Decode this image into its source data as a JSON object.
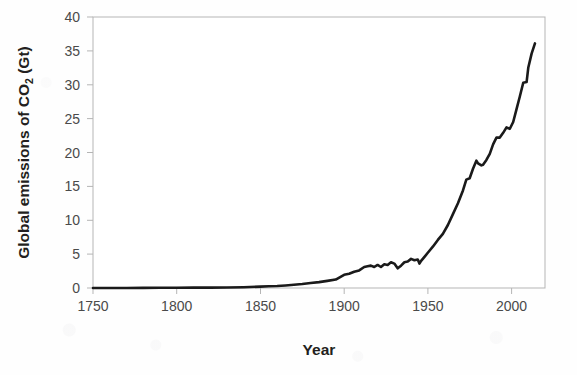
{
  "chart_data": {
    "type": "line",
    "title": "",
    "xlabel": "Year",
    "ylabel": "Global emissions of CO2 (Gt)",
    "ylabel_parts": {
      "pre": "Global emissions of CO",
      "sub": "2",
      "post": " (Gt)"
    },
    "xlim": [
      1750,
      2020
    ],
    "ylim": [
      0,
      40
    ],
    "xticks": [
      1750,
      1800,
      1850,
      1900,
      1950,
      2000
    ],
    "yticks": [
      0,
      5,
      10,
      15,
      20,
      25,
      30,
      35,
      40
    ],
    "xtick_labels": [
      "1750",
      "1800",
      "1850",
      "1900",
      "1950",
      "2000"
    ],
    "ytick_labels": [
      "0",
      "5",
      "10",
      "15",
      "20",
      "25",
      "30",
      "35",
      "40"
    ],
    "grid": false,
    "legend": null,
    "series": [
      {
        "name": "Global CO2 emissions",
        "color": "#1a1a1a",
        "line_width": 2.6,
        "x": [
          1750,
          1760,
          1770,
          1780,
          1790,
          1800,
          1810,
          1820,
          1830,
          1840,
          1850,
          1855,
          1860,
          1865,
          1870,
          1875,
          1880,
          1885,
          1890,
          1895,
          1900,
          1903,
          1906,
          1909,
          1912,
          1914,
          1916,
          1918,
          1920,
          1922,
          1924,
          1926,
          1928,
          1930,
          1932,
          1934,
          1936,
          1938,
          1940,
          1942,
          1944,
          1945,
          1946,
          1948,
          1950,
          1953,
          1956,
          1959,
          1962,
          1965,
          1968,
          1971,
          1973,
          1975,
          1977,
          1979,
          1980,
          1982,
          1983,
          1985,
          1987,
          1989,
          1991,
          1993,
          1995,
          1997,
          1999,
          2001,
          2003,
          2005,
          2007,
          2009,
          2010,
          2012,
          2014
        ],
        "y": [
          0.01,
          0.01,
          0.01,
          0.02,
          0.03,
          0.03,
          0.05,
          0.06,
          0.08,
          0.12,
          0.2,
          0.25,
          0.3,
          0.38,
          0.47,
          0.58,
          0.75,
          0.87,
          1.05,
          1.25,
          1.95,
          2.1,
          2.4,
          2.6,
          3.1,
          3.2,
          3.3,
          3.1,
          3.4,
          3.1,
          3.5,
          3.4,
          3.8,
          3.6,
          2.9,
          3.3,
          3.8,
          3.9,
          4.3,
          4.1,
          4.2,
          3.6,
          4.0,
          4.6,
          5.2,
          6.1,
          7.1,
          8.0,
          9.3,
          10.9,
          12.5,
          14.4,
          16.0,
          16.2,
          17.6,
          18.8,
          18.4,
          18.1,
          18.2,
          18.9,
          19.8,
          21.2,
          22.2,
          22.2,
          22.9,
          23.7,
          23.5,
          24.5,
          26.4,
          28.3,
          30.3,
          30.4,
          32.5,
          34.6,
          36.1
        ]
      }
    ]
  },
  "axes": {
    "frame_color": "#b5b5b5",
    "tick_color": "#b5b5b5",
    "background": "#ffffff"
  }
}
